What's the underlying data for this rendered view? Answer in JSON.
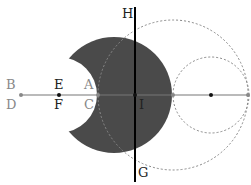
{
  "colors": {
    "fill": "#4a4a4a",
    "axis": "#777777",
    "dashed": "#888888",
    "line": "#000000",
    "label_dark": "#222222",
    "label_gray": "#888888"
  },
  "labels": {
    "B": "B",
    "D": "D",
    "E": "E",
    "F": "F",
    "A": "A",
    "C": "C",
    "H": "H",
    "I": "I",
    "G": "G"
  }
}
